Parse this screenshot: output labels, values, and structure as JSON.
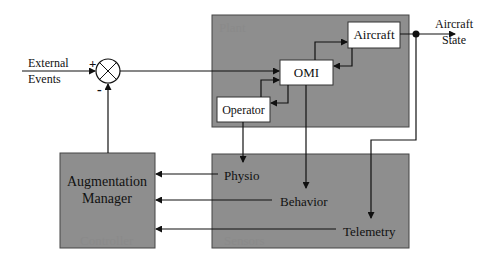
{
  "diagram": {
    "external_input": {
      "line1": "External",
      "line2": "Events"
    },
    "summing_junction": {
      "plus": "+",
      "minus": "-"
    },
    "plant": {
      "label": "Plant",
      "omi": "OMI",
      "aircraft": "Aircraft",
      "operator": "Operator"
    },
    "output": {
      "line1": "Aircraft",
      "line2": "State"
    },
    "controller": {
      "line1": "Augmentation",
      "line2": "Manager",
      "label": "Controller"
    },
    "sensors": {
      "label": "Sensors",
      "physio": "Physio",
      "behavior": "Behavior",
      "telemetry": "Telemetry"
    },
    "colors": {
      "block_fill": "#8e8e8e",
      "box_fill": "#ffffff",
      "line": "#111111",
      "ghost_text": "#7c7c7c"
    }
  }
}
